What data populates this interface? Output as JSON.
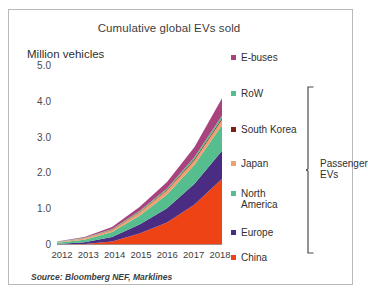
{
  "chart_data": {
    "type": "area",
    "title": "Cumulative global EVs sold",
    "xlabel": "",
    "ylabel": "Million vehicles",
    "stacked": true,
    "grid": false,
    "legend_position": "right",
    "categories": [
      "2012",
      "2013",
      "2014",
      "2015",
      "2016",
      "2017",
      "2018"
    ],
    "x": [
      2012,
      2013,
      2014,
      2015,
      2016,
      2017,
      2018
    ],
    "ylim": [
      0,
      5.0
    ],
    "yticks": [
      "0",
      "1.0",
      "2.0",
      "3.0",
      "4.0",
      "5.0"
    ],
    "ytick_values": [
      0,
      1.0,
      2.0,
      3.0,
      4.0,
      5.0
    ],
    "series": [
      {
        "name": "China",
        "color": "#ee4415",
        "values": [
          0.01,
          0.03,
          0.1,
          0.32,
          0.63,
          1.13,
          1.85
        ]
      },
      {
        "name": "Europe",
        "color": "#4a2d82",
        "values": [
          0.02,
          0.05,
          0.12,
          0.25,
          0.4,
          0.58,
          0.78
        ]
      },
      {
        "name": "North America",
        "color": "#56be8e",
        "values": [
          0.03,
          0.07,
          0.14,
          0.25,
          0.38,
          0.53,
          0.72
        ]
      },
      {
        "name": "Japan",
        "color": "#f0a070",
        "values": [
          0.02,
          0.04,
          0.06,
          0.09,
          0.11,
          0.13,
          0.15
        ]
      },
      {
        "name": "South Korea",
        "color": "#7a2213",
        "values": [
          0.0,
          0.0,
          0.01,
          0.01,
          0.02,
          0.03,
          0.04
        ]
      },
      {
        "name": "RoW",
        "color": "#56be8e",
        "values": [
          0.01,
          0.01,
          0.02,
          0.03,
          0.04,
          0.06,
          0.08
        ]
      },
      {
        "name": "E-buses",
        "color": "#a8437e",
        "values": [
          0.01,
          0.02,
          0.05,
          0.11,
          0.18,
          0.28,
          0.48
        ]
      }
    ],
    "totals": [
      0.1,
      0.22,
      0.5,
      1.06,
      1.76,
      2.74,
      4.1
    ],
    "annotations": [
      {
        "text": "Passenger EVs",
        "covers": [
          "RoW",
          "South Korea",
          "Japan",
          "North America",
          "Europe",
          "China"
        ]
      }
    ],
    "source": "Source: Bloomberg NEF, Marklines"
  },
  "legend": {
    "items": [
      {
        "label": "E-buses",
        "color": "#a8437e"
      },
      {
        "label": "RoW",
        "color": "#56be8e"
      },
      {
        "label": "South Korea",
        "color": "#7a2213"
      },
      {
        "label": "Japan",
        "color": "#f0a070"
      },
      {
        "label": "North America",
        "color": "#56be8e"
      },
      {
        "label": "Europe",
        "color": "#4a2d82"
      },
      {
        "label": "China",
        "color": "#ee4415"
      }
    ]
  },
  "bracket": {
    "label_line1": "Passenger",
    "label_line2": "EVs"
  },
  "footer": {
    "source": "Source: Bloomberg NEF, Marklines"
  }
}
